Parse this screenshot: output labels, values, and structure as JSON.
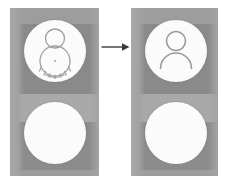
{
  "figure": {
    "type": "before-after comparison",
    "background_color": "#ffffff"
  },
  "panels": [
    {
      "id": "before",
      "name": "before-panel",
      "label": "",
      "background_color": "#9d9d9d",
      "band_dark_color": "#8a8a8a",
      "band_light_color": "#a9a9a9",
      "avatars": [
        {
          "id": "glitched-avatar",
          "name": "glitched-avatar-icon",
          "state": "distorted",
          "disc_color": "#fbfbfb",
          "stroke_color": "#a0a0a0",
          "description": "head circle over a round distorted body outline with tick marks"
        },
        {
          "id": "blank-disc-before",
          "name": "blank-disc",
          "state": "empty",
          "disc_color": "#fbfbfb",
          "stroke_color": "#9a9a9a",
          "description": "plain white circle, no glyph"
        }
      ]
    },
    {
      "id": "after",
      "name": "after-panel",
      "label": "",
      "background_color": "#9d9d9d",
      "band_dark_color": "#8a8a8a",
      "band_light_color": "#a9a9a9",
      "avatars": [
        {
          "id": "clean-avatar",
          "name": "person-avatar-icon",
          "state": "normal",
          "disc_color": "#fbfbfb",
          "stroke_color": "#9a9a9a",
          "description": "head circle above a shoulders arc"
        },
        {
          "id": "blank-disc-after",
          "name": "blank-disc",
          "state": "empty",
          "disc_color": "#fbfbfb",
          "stroke_color": "#9a9a9a",
          "description": "plain white circle, no glyph"
        }
      ]
    }
  ],
  "connector": {
    "name": "right-arrow",
    "direction": "right",
    "color": "#3a3a3a",
    "label": ""
  }
}
